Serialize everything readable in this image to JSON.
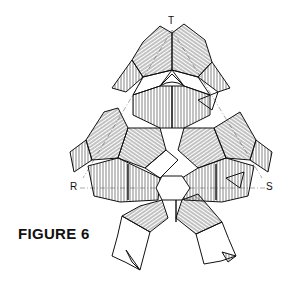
{
  "figure": {
    "caption": "FIGURE 6",
    "labels": {
      "top": "T",
      "left": "R",
      "right": "S"
    },
    "colors": {
      "line": "#111111",
      "hatch": "#333333",
      "background": "#ffffff",
      "axis": "#555555"
    }
  }
}
